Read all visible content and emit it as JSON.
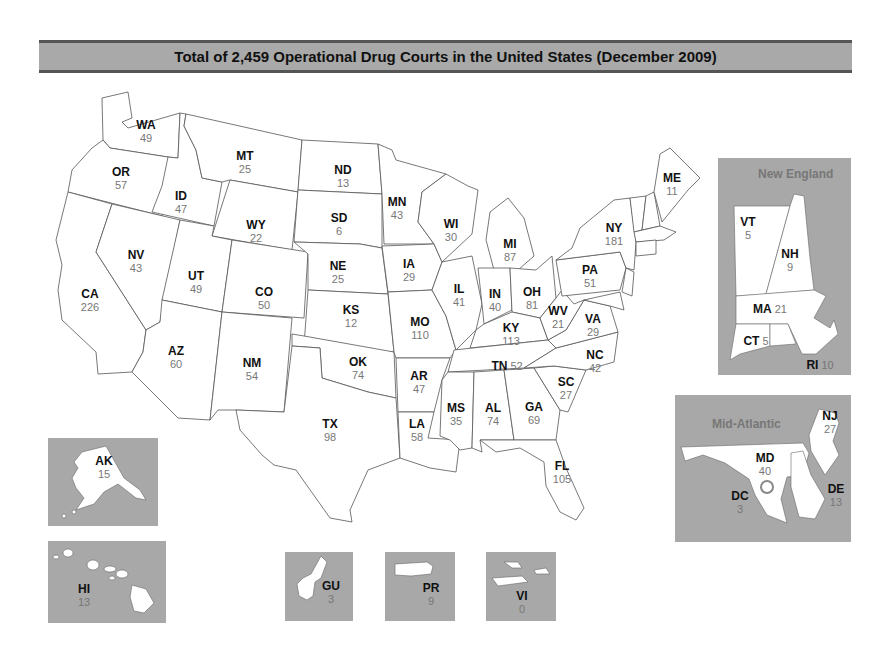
{
  "title": "Total of 2,459 Operational Drug Courts in the United States (December 2009)",
  "colors": {
    "title_bar": "#a9a9a9",
    "inset_bg": "#a8a8a8",
    "state_fill": "#ffffff",
    "abbr_text": "#111111",
    "value_text": "#777777"
  },
  "states": {
    "WA": {
      "abbr": "WA",
      "value": "49"
    },
    "OR": {
      "abbr": "OR",
      "value": "57"
    },
    "CA": {
      "abbr": "CA",
      "value": "226"
    },
    "NV": {
      "abbr": "NV",
      "value": "43"
    },
    "ID": {
      "abbr": "ID",
      "value": "47"
    },
    "MT": {
      "abbr": "MT",
      "value": "25"
    },
    "WY": {
      "abbr": "WY",
      "value": "22"
    },
    "UT": {
      "abbr": "UT",
      "value": "49"
    },
    "CO": {
      "abbr": "CO",
      "value": "50"
    },
    "AZ": {
      "abbr": "AZ",
      "value": "60"
    },
    "NM": {
      "abbr": "NM",
      "value": "54"
    },
    "ND": {
      "abbr": "ND",
      "value": "13"
    },
    "SD": {
      "abbr": "SD",
      "value": "6"
    },
    "NE": {
      "abbr": "NE",
      "value": "25"
    },
    "KS": {
      "abbr": "KS",
      "value": "12"
    },
    "OK": {
      "abbr": "OK",
      "value": "74"
    },
    "TX": {
      "abbr": "TX",
      "value": "98"
    },
    "MN": {
      "abbr": "MN",
      "value": "43"
    },
    "IA": {
      "abbr": "IA",
      "value": "29"
    },
    "MO": {
      "abbr": "MO",
      "value": "110"
    },
    "AR": {
      "abbr": "AR",
      "value": "47"
    },
    "LA": {
      "abbr": "LA",
      "value": "58"
    },
    "WI": {
      "abbr": "WI",
      "value": "30"
    },
    "IL": {
      "abbr": "IL",
      "value": "41"
    },
    "MI": {
      "abbr": "MI",
      "value": "87"
    },
    "IN": {
      "abbr": "IN",
      "value": "40"
    },
    "OH": {
      "abbr": "OH",
      "value": "81"
    },
    "KY": {
      "abbr": "KY",
      "value": "113"
    },
    "TN": {
      "abbr": "TN",
      "value": "52"
    },
    "MS": {
      "abbr": "MS",
      "value": "35"
    },
    "AL": {
      "abbr": "AL",
      "value": "74"
    },
    "GA": {
      "abbr": "GA",
      "value": "69"
    },
    "FL": {
      "abbr": "FL",
      "value": "105"
    },
    "SC": {
      "abbr": "SC",
      "value": "27"
    },
    "NC": {
      "abbr": "NC",
      "value": "42"
    },
    "VA": {
      "abbr": "VA",
      "value": "29"
    },
    "WV": {
      "abbr": "WV",
      "value": "21"
    },
    "PA": {
      "abbr": "PA",
      "value": "51"
    },
    "NY": {
      "abbr": "NY",
      "value": "181"
    },
    "ME": {
      "abbr": "ME",
      "value": "11"
    }
  },
  "insets": {
    "new_england": {
      "title": "New England",
      "VT": {
        "abbr": "VT",
        "value": "5"
      },
      "NH": {
        "abbr": "NH",
        "value": "9"
      },
      "MA": {
        "abbr": "MA",
        "value": "21"
      },
      "CT": {
        "abbr": "CT",
        "value": "5"
      },
      "RI": {
        "abbr": "RI",
        "value": "10"
      }
    },
    "mid_atlantic": {
      "title": "Mid-Atlantic",
      "NJ": {
        "abbr": "NJ",
        "value": "27"
      },
      "MD": {
        "abbr": "MD",
        "value": "40"
      },
      "DC": {
        "abbr": "DC",
        "value": "3"
      },
      "DE": {
        "abbr": "DE",
        "value": "13"
      }
    },
    "AK": {
      "abbr": "AK",
      "value": "15"
    },
    "HI": {
      "abbr": "HI",
      "value": "13"
    },
    "GU": {
      "abbr": "GU",
      "value": "3"
    },
    "PR": {
      "abbr": "PR",
      "value": "9"
    },
    "VI": {
      "abbr": "VI",
      "value": "0"
    }
  }
}
